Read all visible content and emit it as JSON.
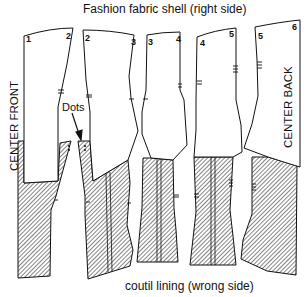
{
  "diagram": {
    "top_caption": "Fashion fabric shell (right side)",
    "bottom_caption": "coutil lining (wrong side)",
    "center_front_label": "CENTER FRONT",
    "center_back_label": "CENTER BACK",
    "callout_label": "Dots",
    "piece_numbers": [
      {
        "text": "1",
        "x": 26,
        "y": 34
      },
      {
        "text": "2",
        "x": 69,
        "y": 31
      },
      {
        "text": "2",
        "x": 84,
        "y": 33
      },
      {
        "text": "3",
        "x": 131,
        "y": 38
      },
      {
        "text": "3",
        "x": 148,
        "y": 38
      },
      {
        "text": "4",
        "x": 177,
        "y": 37
      },
      {
        "text": "4",
        "x": 200,
        "y": 40
      },
      {
        "text": "5",
        "x": 229,
        "y": 31
      },
      {
        "text": "5",
        "x": 259,
        "y": 33
      },
      {
        "text": "6",
        "x": 293,
        "y": 24
      }
    ],
    "colors": {
      "outline": "#111111",
      "hatch": "#555555",
      "fabric_fill": "#ffffff"
    }
  }
}
